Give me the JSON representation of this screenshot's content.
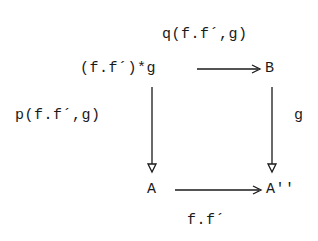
{
  "diagram": {
    "type": "commutative-square",
    "nodes": {
      "top_left": "(f.f´)*g",
      "top_right": "B",
      "bottom_left": "A",
      "bottom_right": "A''"
    },
    "edges": {
      "top": {
        "from": "(f.f´)*g",
        "to": "B",
        "label": "q(f.f´,g)"
      },
      "left": {
        "from": "(f.f´)*g",
        "to": "A",
        "label": "p(f.f´,g)"
      },
      "right": {
        "from": "B",
        "to": "A''",
        "label": "g"
      },
      "bottom": {
        "from": "A",
        "to": "A''",
        "label": "f.f´"
      }
    },
    "colors": {
      "ink": "#1a1a1a",
      "background": "#ffffff"
    }
  }
}
